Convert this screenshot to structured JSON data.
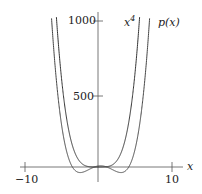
{
  "chart_data": {
    "type": "line",
    "title": "",
    "xlabel": "x",
    "ylabel": "",
    "xlim": [
      -10,
      10
    ],
    "ylim": [
      0,
      1000
    ],
    "x_ticks": [
      -10,
      10
    ],
    "x_tick_labels": [
      "−10",
      "10"
    ],
    "y_ticks": [
      500,
      1000
    ],
    "y_tick_labels": [
      "500",
      "1000"
    ],
    "grid": false,
    "series": [
      {
        "name": "x^4",
        "label": "x",
        "label_sup": "4",
        "formula": "x^4",
        "color": "#333333"
      },
      {
        "name": "p(x)",
        "label": "p(x)",
        "formula": "quartic polynomial close to x^4 with small wiggles near origin",
        "color": "#555555"
      }
    ],
    "annotations": [
      "x^4",
      "p(x)"
    ]
  },
  "labels": {
    "x_axis": "x",
    "tick_neg10": "−10",
    "tick_10": "10",
    "tick_500": "500",
    "tick_1000": "1000",
    "x4_base": "x",
    "x4_sup": "4",
    "px": "p(x)"
  }
}
